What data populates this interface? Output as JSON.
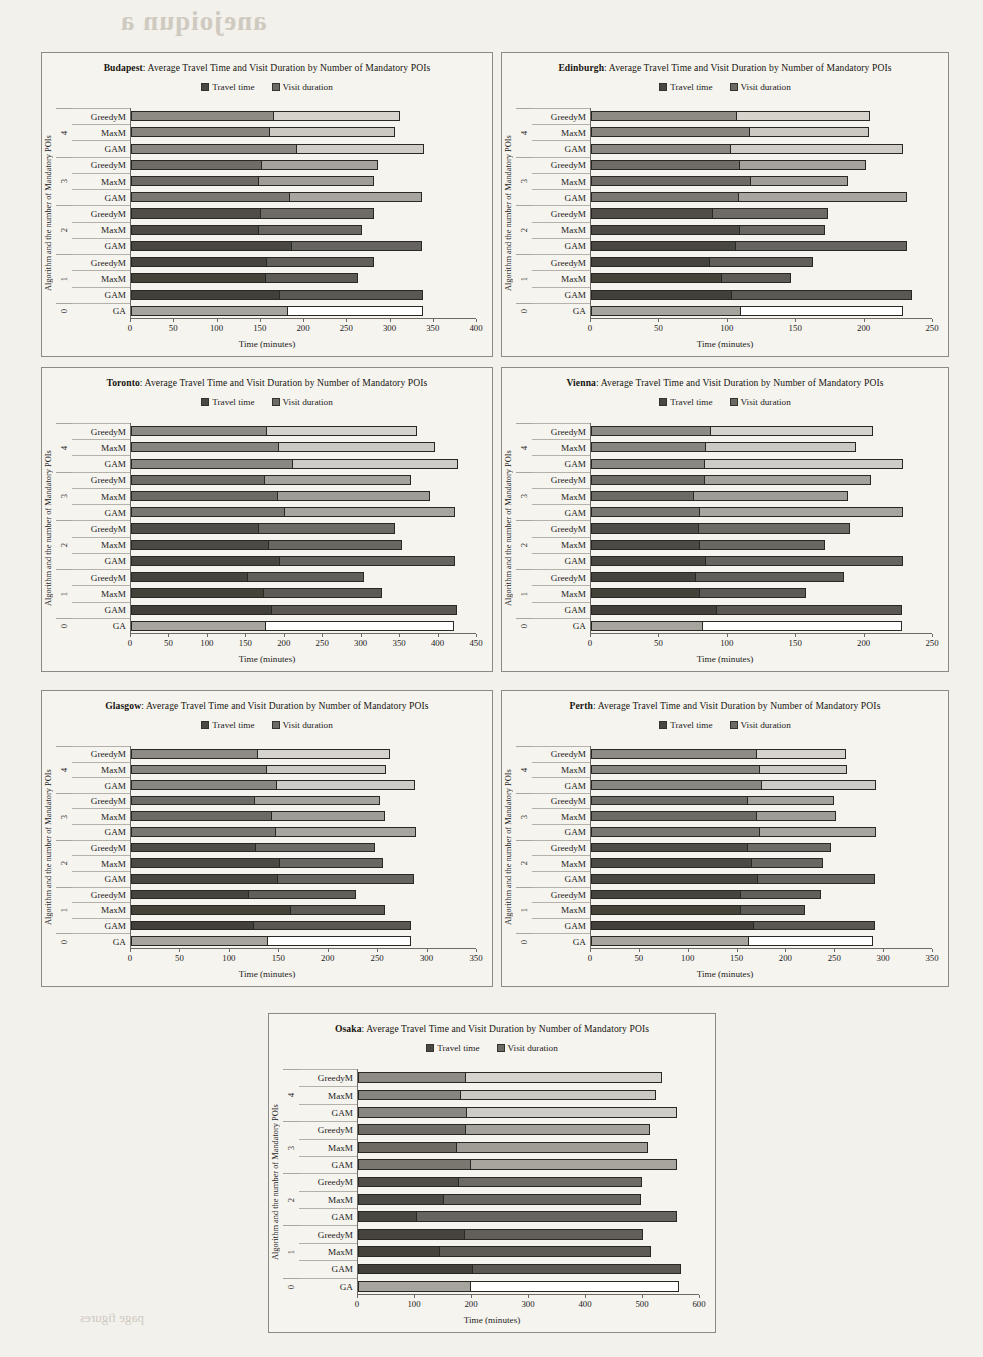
{
  "page": {
    "background_color": "#f3f1ec",
    "bleed_text": [
      "anejoiqun a",
      "coinjecture",
      "supplementary",
      "appendix note",
      "page figures"
    ]
  },
  "legend": {
    "travel_label": "Travel time",
    "visit_label": "Visit duration",
    "travel_color": "#4a4843",
    "visit_color": "#6d6a64"
  },
  "common": {
    "title_suffix": ": Average Travel Time and Visit Duration by Number of Mandatory POIs",
    "xlabel": "Time (minutes)",
    "ylabel": "Algorithm and the number of Mandatory POIs",
    "group_labels": [
      "4",
      "3",
      "2",
      "1",
      "0"
    ],
    "algorithms": [
      "GreedyM",
      "MaxM",
      "GAM"
    ],
    "baseline_algorithm": "GA"
  },
  "chart_data": [
    {
      "type": "bar",
      "subtype": "stacked-horizontal",
      "city": "Budapest",
      "title": "Budapest: Average Travel Time and Visit Duration by Number of Mandatory POIs",
      "xlabel": "Time (minutes)",
      "ylabel": "Algorithm and the number of Mandatory POIs",
      "xlim": [
        0,
        400
      ],
      "xticks": [
        0,
        50,
        100,
        150,
        200,
        250,
        300,
        350,
        400
      ],
      "grid": false,
      "legend_position": "top",
      "categories": [
        "4 GreedyM",
        "4 MaxM",
        "4 GAM",
        "3 GreedyM",
        "3 MaxM",
        "3 GAM",
        "2 GreedyM",
        "2 MaxM",
        "2 GAM",
        "1 GreedyM",
        "1 MaxM",
        "1 GAM",
        "0 GA"
      ],
      "series": [
        {
          "name": "Travel time",
          "values": [
            165,
            161,
            192,
            151,
            148,
            184,
            150,
            148,
            186,
            157,
            156,
            172,
            181
          ]
        },
        {
          "name": "Visit duration",
          "values": [
            146,
            144,
            147,
            134,
            133,
            152,
            131,
            119,
            151,
            124,
            107,
            166,
            156
          ]
        }
      ],
      "totals": [
        311,
        305,
        339,
        285,
        281,
        336,
        281,
        267,
        337,
        281,
        263,
        338,
        337
      ]
    },
    {
      "type": "bar",
      "subtype": "stacked-horizontal",
      "city": "Edinburgh",
      "title": "Edinburgh: Average Travel Time and Visit Duration by Number of Mandatory POIs",
      "xlabel": "Time (minutes)",
      "ylabel": "Algorithm and the number of Mandatory POIs",
      "xlim": [
        0,
        250
      ],
      "xticks": [
        0,
        50,
        100,
        150,
        200,
        250
      ],
      "grid": false,
      "legend_position": "top",
      "categories": [
        "4 GreedyM",
        "4 MaxM",
        "4 GAM",
        "3 GreedyM",
        "3 MaxM",
        "3 GAM",
        "2 GreedyM",
        "2 MaxM",
        "2 GAM",
        "1 GreedyM",
        "1 MaxM",
        "1 GAM",
        "0 GA"
      ],
      "series": [
        {
          "name": "Travel time",
          "values": [
            107,
            116,
            102,
            109,
            117,
            108,
            89,
            109,
            106,
            87,
            96,
            103,
            110
          ]
        },
        {
          "name": "Visit duration",
          "values": [
            97,
            87,
            126,
            92,
            71,
            123,
            84,
            62,
            125,
            75,
            50,
            132,
            118
          ]
        }
      ],
      "totals": [
        204,
        203,
        228,
        201,
        188,
        231,
        173,
        171,
        231,
        162,
        146,
        235,
        228
      ]
    },
    {
      "type": "bar",
      "subtype": "stacked-horizontal",
      "city": "Toronto",
      "title": "Toronto: Average Travel Time and Visit Duration by Number of Mandatory POIs",
      "xlabel": "Time (minutes)",
      "ylabel": "Algorithm and the number of Mandatory POIs",
      "xlim": [
        0,
        450
      ],
      "xticks": [
        0,
        50,
        100,
        150,
        200,
        250,
        300,
        350,
        400,
        450
      ],
      "grid": false,
      "legend_position": "top",
      "categories": [
        "4 GreedyM",
        "4 MaxM",
        "4 GAM",
        "3 GreedyM",
        "3 MaxM",
        "3 GAM",
        "2 GreedyM",
        "2 MaxM",
        "2 GAM",
        "1 GreedyM",
        "1 MaxM",
        "1 GAM",
        "0 GA"
      ],
      "series": [
        {
          "name": "Travel time",
          "values": [
            177,
            193,
            211,
            174,
            191,
            200,
            167,
            180,
            194,
            152,
            173,
            184,
            176
          ]
        },
        {
          "name": "Visit duration",
          "values": [
            195,
            203,
            214,
            190,
            198,
            221,
            177,
            173,
            228,
            151,
            154,
            240,
            244
          ]
        }
      ],
      "totals": [
        372,
        396,
        425,
        364,
        389,
        421,
        344,
        353,
        422,
        303,
        327,
        424,
        420
      ]
    },
    {
      "type": "bar",
      "subtype": "stacked-horizontal",
      "city": "Vienna",
      "title": "Vienna: Average Travel Time and Visit Duration by Number of Mandatory POIs",
      "xlabel": "Time (minutes)",
      "ylabel": "Algorithm and the number of Mandatory POIs",
      "xlim": [
        0,
        250
      ],
      "xticks": [
        0,
        50,
        100,
        150,
        200,
        250
      ],
      "grid": false,
      "legend_position": "top",
      "categories": [
        "4 GreedyM",
        "4 MaxM",
        "4 GAM",
        "3 GreedyM",
        "3 MaxM",
        "3 GAM",
        "2 GreedyM",
        "2 MaxM",
        "2 GAM",
        "1 GreedyM",
        "1 MaxM",
        "1 GAM",
        "0 GA"
      ],
      "series": [
        {
          "name": "Travel time",
          "values": [
            88,
            84,
            83,
            83,
            75,
            80,
            79,
            80,
            84,
            77,
            80,
            92,
            82
          ]
        },
        {
          "name": "Visit duration",
          "values": [
            118,
            110,
            145,
            122,
            113,
            148,
            110,
            91,
            144,
            108,
            77,
            135,
            145
          ]
        }
      ],
      "totals": [
        206,
        194,
        228,
        205,
        188,
        228,
        189,
        171,
        228,
        185,
        157,
        227,
        227
      ]
    },
    {
      "type": "bar",
      "subtype": "stacked-horizontal",
      "city": "Glasgow",
      "title": "Glasgow: Average Travel Time and Visit Duration by Number of Mandatory POIs",
      "xlabel": "Time (minutes)",
      "ylabel": "Algorithm and the number of Mandatory POIs",
      "xlim": [
        0,
        350
      ],
      "xticks": [
        0,
        50,
        100,
        150,
        200,
        250,
        300,
        350
      ],
      "grid": false,
      "legend_position": "top",
      "categories": [
        "4 GreedyM",
        "4 MaxM",
        "4 GAM",
        "3 GreedyM",
        "3 MaxM",
        "3 GAM",
        "2 GreedyM",
        "2 MaxM",
        "2 GAM",
        "1 GreedyM",
        "1 MaxM",
        "1 GAM",
        "0 GA"
      ],
      "series": [
        {
          "name": "Travel time",
          "values": [
            128,
            138,
            148,
            125,
            143,
            147,
            126,
            151,
            149,
            119,
            162,
            124,
            139
          ]
        },
        {
          "name": "Visit duration",
          "values": [
            134,
            120,
            139,
            127,
            114,
            141,
            121,
            104,
            137,
            109,
            95,
            159,
            144
          ]
        }
      ],
      "totals": [
        262,
        258,
        287,
        252,
        257,
        288,
        247,
        255,
        286,
        228,
        257,
        283,
        283
      ]
    },
    {
      "type": "bar",
      "subtype": "stacked-horizontal",
      "city": "Perth",
      "title": "Perth: Average Travel Time and Visit Duration by Number of Mandatory POIs",
      "xlabel": "Time (minutes)",
      "ylabel": "Algorithm and the number of Mandatory POIs",
      "xlim": [
        0,
        350
      ],
      "xticks": [
        0,
        50,
        100,
        150,
        200,
        250,
        300,
        350
      ],
      "grid": false,
      "legend_position": "top",
      "categories": [
        "4 GreedyM",
        "4 MaxM",
        "4 GAM",
        "3 GreedyM",
        "3 MaxM",
        "3 GAM",
        "2 GreedyM",
        "2 MaxM",
        "2 GAM",
        "1 GreedyM",
        "1 MaxM",
        "1 GAM",
        "0 GA"
      ],
      "series": [
        {
          "name": "Travel time",
          "values": [
            170,
            173,
            175,
            161,
            170,
            173,
            161,
            165,
            171,
            154,
            153,
            167,
            162
          ]
        },
        {
          "name": "Visit duration",
          "values": [
            91,
            89,
            117,
            88,
            81,
            119,
            85,
            72,
            120,
            81,
            66,
            124,
            127
          ]
        }
      ],
      "totals": [
        261,
        262,
        292,
        249,
        251,
        292,
        246,
        237,
        291,
        235,
        219,
        291,
        289
      ]
    },
    {
      "type": "bar",
      "subtype": "stacked-horizontal",
      "city": "Osaka",
      "title": "Osaka: Average Travel Time and Visit Duration by Number of Mandatory POIs",
      "xlabel": "Time (minutes)",
      "ylabel": "Algorithm and the number of Mandatory POIs",
      "xlim": [
        0,
        600
      ],
      "xticks": [
        0,
        100,
        200,
        300,
        400,
        500,
        600
      ],
      "grid": false,
      "legend_position": "top",
      "categories": [
        "4 GreedyM",
        "4 MaxM",
        "4 GAM",
        "3 GreedyM",
        "3 MaxM",
        "3 GAM",
        "2 GreedyM",
        "2 MaxM",
        "2 GAM",
        "1 GreedyM",
        "1 MaxM",
        "1 GAM",
        "0 GA"
      ],
      "series": [
        {
          "name": "Travel time",
          "values": [
            190,
            180,
            192,
            189,
            174,
            198,
            178,
            150,
            104,
            187,
            143,
            202,
            199
          ]
        },
        {
          "name": "Visit duration",
          "values": [
            343,
            343,
            368,
            324,
            334,
            362,
            321,
            347,
            456,
            313,
            371,
            365,
            364
          ]
        }
      ],
      "totals": [
        533,
        523,
        560,
        513,
        508,
        560,
        499,
        497,
        560,
        500,
        514,
        567,
        563
      ]
    }
  ]
}
